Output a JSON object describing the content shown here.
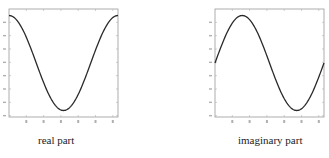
{
  "chart_data": [
    {
      "type": "line",
      "title": "",
      "caption": "real part",
      "xlabel": "",
      "ylabel": "",
      "x_ticks_count": 6,
      "y_ticks_count": 8,
      "xlim": [
        0,
        1
      ],
      "ylim": [
        -1,
        1
      ],
      "grid": false,
      "series": [
        {
          "name": "real part",
          "function": "cos(2*pi*t)",
          "x": [
            0,
            0.125,
            0.25,
            0.375,
            0.5,
            0.625,
            0.75,
            0.875,
            1.0
          ],
          "values": [
            1.0,
            0.707,
            0.0,
            -0.707,
            -1.0,
            -0.707,
            0.0,
            0.707,
            1.0
          ]
        }
      ]
    },
    {
      "type": "line",
      "title": "",
      "caption": "imaginary part",
      "xlabel": "",
      "ylabel": "",
      "x_ticks_count": 6,
      "y_ticks_count": 8,
      "xlim": [
        0,
        1
      ],
      "ylim": [
        -1,
        1
      ],
      "grid": false,
      "series": [
        {
          "name": "imaginary part",
          "function": "sin(2*pi*t)",
          "x": [
            0,
            0.125,
            0.25,
            0.375,
            0.5,
            0.625,
            0.75,
            0.875,
            1.0
          ],
          "values": [
            0.0,
            0.707,
            1.0,
            0.707,
            0.0,
            -0.707,
            -1.0,
            -0.707,
            0.0
          ]
        }
      ]
    }
  ],
  "captions": {
    "left": "real part",
    "right": "imaginary part"
  },
  "colors": {
    "curve": "#2a2a2a",
    "frame": "#9a9a9a",
    "ticks": "#b0b0b0"
  }
}
